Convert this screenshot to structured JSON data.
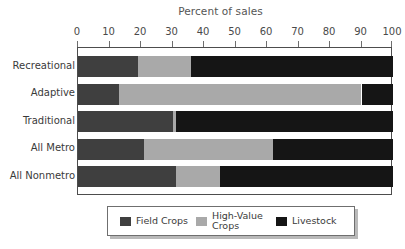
{
  "chart_data": {
    "type": "bar",
    "orientation": "horizontal",
    "stacked": true,
    "normalized": true,
    "title": "Percent of sales",
    "xlabel": "",
    "ylabel": "",
    "xlim": [
      0,
      100
    ],
    "xticks": [
      0,
      10,
      20,
      30,
      40,
      50,
      60,
      70,
      80,
      90,
      100
    ],
    "xtick_labels": [
      "0",
      "10",
      "20",
      "30",
      "40",
      "50",
      "60",
      "70",
      "80",
      "90",
      "100"
    ],
    "grid": false,
    "legend_position": "bottom",
    "categories": [
      "Recreational",
      "Adaptive",
      "Traditional",
      "All Metro",
      "All Nonmetro"
    ],
    "series": [
      {
        "name": "Field Crops",
        "color": "#3f3f3f",
        "values": [
          19,
          13,
          30,
          21,
          31
        ]
      },
      {
        "name": "High-Value\nCrops",
        "color": "#a9a9a9",
        "values": [
          17,
          77,
          1,
          41,
          14
        ]
      },
      {
        "name": "Livestock",
        "color": "#151515",
        "values": [
          64,
          10,
          69,
          38,
          55
        ]
      }
    ]
  },
  "legend": {
    "items": [
      {
        "label": "Field Crops",
        "swatch_class": "field"
      },
      {
        "label": "High-Value\nCrops",
        "swatch_class": "highval"
      },
      {
        "label": "Livestock",
        "swatch_class": "livestock"
      }
    ]
  },
  "colors": {
    "field_crops": "#3f3f3f",
    "high_value_crops": "#a9a9a9",
    "livestock": "#151515",
    "axis": "#4d4d4d",
    "text": "#3a3a3a"
  }
}
